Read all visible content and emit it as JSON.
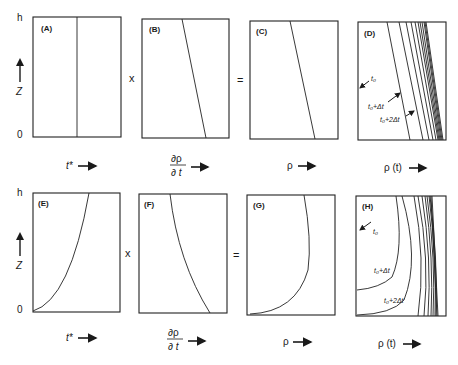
{
  "figure": {
    "rows": [
      {
        "axis": {
          "top": "h",
          "bottom": "0",
          "var": "Z"
        },
        "operators": [
          "x",
          "="
        ],
        "panels": [
          {
            "id": "A",
            "label": "(A)",
            "xlabel": "t*"
          },
          {
            "id": "B",
            "label": "(B)",
            "xlabel_num": "∂ρ",
            "xlabel_den": "∂ t"
          },
          {
            "id": "C",
            "label": "(C)",
            "xlabel": "ρ"
          },
          {
            "id": "D",
            "label": "(D)",
            "xlabel": "ρ (t)",
            "annotations": [
              "t₀",
              "t₀+Δt",
              "t₀+2Δt"
            ]
          }
        ]
      },
      {
        "axis": {
          "top": "h",
          "bottom": "0",
          "var": "Z"
        },
        "operators": [
          "x",
          "="
        ],
        "panels": [
          {
            "id": "E",
            "label": "(E)",
            "xlabel": "t*"
          },
          {
            "id": "F",
            "label": "(F)",
            "xlabel_num": "∂ρ",
            "xlabel_den": "∂ t"
          },
          {
            "id": "G",
            "label": "(G)",
            "xlabel": "ρ"
          },
          {
            "id": "H",
            "label": "(H)",
            "xlabel": "ρ (t)",
            "annotations": [
              "t₀",
              "t₀+Δt",
              "t₀+2Δt"
            ]
          }
        ]
      }
    ]
  }
}
